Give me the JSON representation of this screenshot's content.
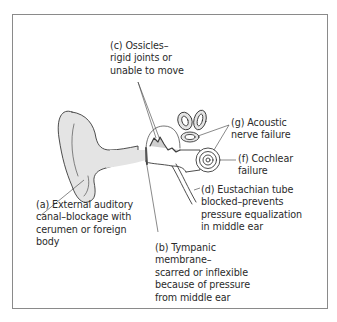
{
  "diagram": {
    "type": "anatomical-ear-diagram",
    "colors": {
      "fill": "#e4e4e4",
      "stroke": "#3a3a3a",
      "frame": "#8a8a8a",
      "text": "#2a2a2a"
    },
    "labels": {
      "a": "(a) External auditory\ncanal–blockage with\ncerumen or foreign\nbody",
      "b": "(b) Tympanic\nmembrane–\nscarred or inflexible\nbecause of pressure\nfrom middle ear",
      "c": "(c) Ossicles–\nrigid joints or\nunable to move",
      "d": "(d) Eustachian tube\nblocked–prevents\npressure equalization\nin middle ear",
      "f": "(f) Cochlear\nfailure",
      "g": "(g) Acoustic\nnerve failure"
    }
  }
}
